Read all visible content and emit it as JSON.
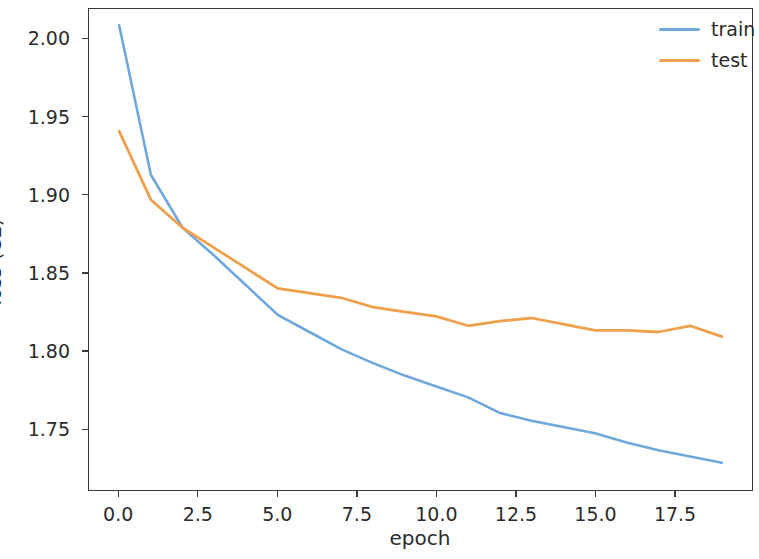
{
  "chart_data": {
    "type": "line",
    "title": "",
    "xlabel": "epoch",
    "ylabel": "loss (CE)",
    "x": [
      0,
      1,
      2,
      3,
      4,
      5,
      6,
      7,
      8,
      9,
      10,
      11,
      12,
      13,
      14,
      15,
      16,
      17,
      18,
      19
    ],
    "series": [
      {
        "name": "train",
        "color": "#6ea8dc",
        "values": [
          2.009,
          1.913,
          1.879,
          1.861,
          1.842,
          1.823,
          1.812,
          1.801,
          1.792,
          1.784,
          1.777,
          1.77,
          1.76,
          1.755,
          1.751,
          1.747,
          1.741,
          1.736,
          1.732,
          1.728
        ]
      },
      {
        "name": "test",
        "color": "#f0a04b",
        "values": [
          1.941,
          1.897,
          1.879,
          1.866,
          1.853,
          1.84,
          1.837,
          1.834,
          1.828,
          1.825,
          1.822,
          1.816,
          1.819,
          1.821,
          1.817,
          1.813,
          1.813,
          1.812,
          1.816,
          1.809
        ]
      }
    ],
    "xlim": [
      -0.95,
      19.95
    ],
    "ylim": [
      1.7105,
      2.0195
    ],
    "xticks": [
      "0.0",
      "2.5",
      "5.0",
      "7.5",
      "10.0",
      "12.5",
      "15.0",
      "17.5"
    ],
    "xtick_values": [
      0.0,
      2.5,
      5.0,
      7.5,
      10.0,
      12.5,
      15.0,
      17.5
    ],
    "yticks": [
      "2.00",
      "1.95",
      "1.90",
      "1.85",
      "1.80",
      "1.75"
    ],
    "ytick_values": [
      2.0,
      1.95,
      1.9,
      1.85,
      1.8,
      1.75
    ],
    "grid": false,
    "legend_position": "upper right",
    "legend": [
      "train",
      "test"
    ]
  },
  "legend": {
    "entries": [
      {
        "label": "train",
        "color": "#6ea8dc"
      },
      {
        "label": "test",
        "color": "#f0a04b"
      }
    ]
  },
  "axes": {
    "xlabel": "epoch",
    "ylabel": "loss (CE)"
  }
}
